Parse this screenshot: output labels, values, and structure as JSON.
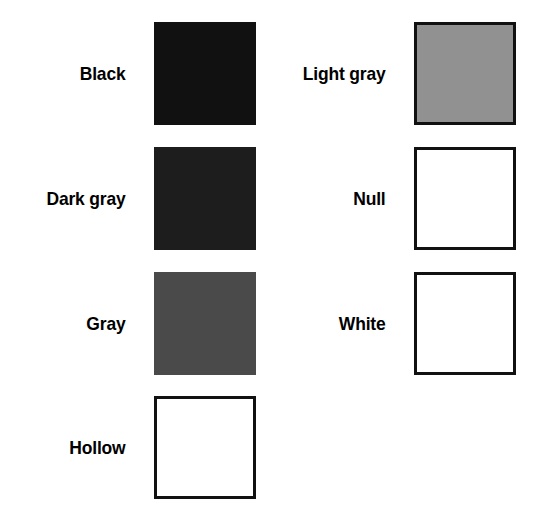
{
  "page": {
    "background_color": "#ffffff",
    "width": 533,
    "height": 528,
    "columns": 2,
    "rows": 4
  },
  "legend": {
    "left_column": [
      {
        "label": "Black",
        "fill_color": "#111111",
        "border_color": "none",
        "style": "solid",
        "swatch_name": "swatch-black"
      },
      {
        "label": "Dark gray",
        "fill_color": "#1d1d1d",
        "border_color": "none",
        "style": "solid",
        "swatch_name": "swatch-dark-gray"
      },
      {
        "label": "Gray",
        "fill_color": "#4a4a4a",
        "border_color": "none",
        "style": "solid",
        "swatch_name": "swatch-gray"
      },
      {
        "label": "Hollow",
        "fill_color": "#ffffff",
        "border_color": "#111111",
        "style": "outline",
        "swatch_name": "swatch-hollow"
      }
    ],
    "right_column": [
      {
        "label": "Light gray",
        "fill_color": "#919191",
        "border_color": "#111111",
        "style": "bordered",
        "swatch_name": "swatch-light-gray"
      },
      {
        "label": "Null",
        "fill_color": "#ffffff",
        "border_color": "#111111",
        "style": "outline",
        "swatch_name": "swatch-null"
      },
      {
        "label": "White",
        "fill_color": "#ffffff",
        "border_color": "#111111",
        "style": "outline",
        "swatch_name": "swatch-white"
      },
      {
        "label": "",
        "fill_color": "",
        "border_color": "",
        "style": "empty",
        "swatch_name": "swatch-empty"
      }
    ]
  }
}
